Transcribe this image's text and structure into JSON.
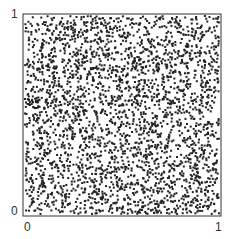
{
  "chart_data": {
    "type": "scatter",
    "title": "",
    "xlabel": "",
    "ylabel": "",
    "xlim": [
      0,
      1
    ],
    "ylim": [
      0,
      1
    ],
    "xticks": [
      "0",
      "1"
    ],
    "yticks": [
      "0",
      "1"
    ],
    "grid": false,
    "legend": null,
    "series": [
      {
        "name": "uniform random points",
        "distribution": "uniform on [0,1]x[0,1]",
        "count": 3000,
        "seed": 12345,
        "marker": "square",
        "marker_size_px": 2,
        "color": "#222222"
      }
    ]
  },
  "axes": {
    "frame_color": "#333333",
    "x_tick_labels": [
      "0",
      "1"
    ],
    "y_tick_labels": [
      "0",
      "1"
    ]
  }
}
